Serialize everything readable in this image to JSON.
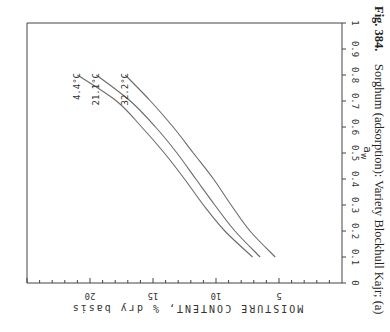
{
  "caption": {
    "fig_label": "Fig. 384.",
    "text": "Sorghum (adsorption): Variety Blockhull Kajr; (a)"
  },
  "chart_data": {
    "type": "line",
    "title": "",
    "orientation_note": "figure printed rotated 90° clockwise",
    "xlabel": "a_w",
    "ylabel": "MOISTURE CONTENT, % dry basis",
    "xlim": [
      0,
      1
    ],
    "ylim": [
      0,
      25
    ],
    "x_ticks": [
      "0",
      "0.1",
      "0.2",
      "0.3",
      "0.4",
      "0.5",
      "0.6",
      "0.7",
      "0.8",
      "0.9",
      "1"
    ],
    "y_ticks": [
      "5",
      "10",
      "15",
      "20"
    ],
    "grid": false,
    "series": [
      {
        "name": "4.4°C",
        "x": [
          0.1,
          0.2,
          0.3,
          0.4,
          0.5,
          0.6,
          0.7,
          0.8
        ],
        "values": [
          7.1,
          9.3,
          11.0,
          12.5,
          14.1,
          15.9,
          17.9,
          21.0
        ]
      },
      {
        "name": "21.1°C",
        "x": [
          0.1,
          0.2,
          0.3,
          0.4,
          0.5,
          0.6,
          0.7,
          0.8
        ],
        "values": [
          6.5,
          8.5,
          10.1,
          11.6,
          13.1,
          14.8,
          16.8,
          19.5
        ]
      },
      {
        "name": "32.2°C",
        "x": [
          0.1,
          0.2,
          0.3,
          0.4,
          0.5,
          0.6,
          0.7,
          0.8
        ],
        "values": [
          5.3,
          7.3,
          8.8,
          10.2,
          11.8,
          13.4,
          15.2,
          17.2
        ]
      }
    ],
    "annotations": [
      "4.4°C",
      "21.1°C",
      "32.2°C"
    ]
  },
  "colors": {
    "line": "#6b6b6b",
    "axis": "#444444",
    "text": "#333333"
  }
}
